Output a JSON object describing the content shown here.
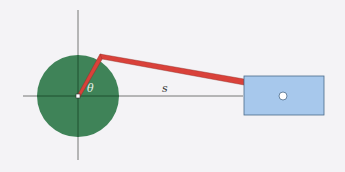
{
  "diagram": {
    "type": "crank-slider mechanism",
    "labels": {
      "angle": "θ",
      "distance": "s"
    },
    "colors": {
      "background": "#f4f3f6",
      "crank_disk": "#2f7a4a",
      "rod": "#d9413a",
      "slider_block": "#a7c8ec",
      "axes": "#555555"
    }
  }
}
